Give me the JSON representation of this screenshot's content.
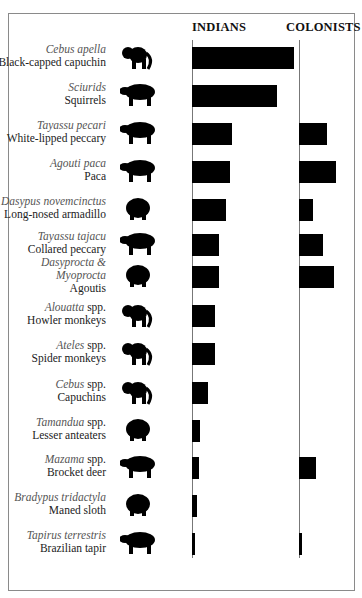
{
  "chart_data": {
    "type": "bar",
    "orientation": "horizontal",
    "title": "",
    "xlabel": "",
    "ylabel": "",
    "grid": false,
    "legend": null,
    "units": "relative bar length (no axis ticks shown; px from baseline at 1:1)",
    "categories": [
      "Black-capped capuchin",
      "Squirrels",
      "White-lipped peccary",
      "Paca",
      "Long-nosed armadillo",
      "Collared peccary",
      "Agoutis",
      "Howler monkeys",
      "Spider monkeys",
      "Capuchins",
      "Lesser anteaters",
      "Brocket deer",
      "Maned sloth",
      "Brazilian tapir"
    ],
    "series": [
      {
        "name": "INDIANS",
        "values": [
          102,
          85,
          40,
          38,
          34,
          27,
          27,
          23,
          23,
          16,
          8,
          7,
          5,
          3
        ]
      },
      {
        "name": "COLONISTS",
        "values": [
          0,
          0,
          28,
          37,
          14,
          24,
          35,
          0,
          0,
          0,
          0,
          17,
          0,
          3
        ]
      }
    ]
  },
  "headers": {
    "indians": "INDIANS",
    "colonists": "COLONISTS"
  },
  "rows": [
    {
      "sci": "Cebus apella",
      "sci_suffix": "",
      "common": "Black-capped capuchin",
      "icon": "capuchin-silhouette-icon"
    },
    {
      "sci": "Sciurids",
      "sci_suffix": "",
      "common": "Squirrels",
      "icon": "squirrel-silhouette-icon"
    },
    {
      "sci": "Tayassu pecari",
      "sci_suffix": "",
      "common": "White-lipped peccary",
      "icon": "peccary-silhouette-icon"
    },
    {
      "sci": "Agouti paca",
      "sci_suffix": "",
      "common": "Paca",
      "icon": "paca-silhouette-icon"
    },
    {
      "sci": "Dasypus novemcinctus",
      "sci_suffix": "",
      "common": "Long-nosed armadillo",
      "icon": "armadillo-silhouette-icon"
    },
    {
      "sci": "Tayassu tajacu",
      "sci_suffix": "",
      "common": "Collared peccary",
      "icon": "collared-peccary-silhouette-icon"
    },
    {
      "sci": "Dasyprocta &",
      "sci2": "Myoprocta",
      "sci_suffix": "",
      "common": "Agoutis",
      "icon": "agouti-silhouette-icon"
    },
    {
      "sci": "Alouatta",
      "sci_suffix": " spp.",
      "common": "Howler monkeys",
      "icon": "howler-monkey-silhouette-icon"
    },
    {
      "sci": "Ateles",
      "sci_suffix": " spp.",
      "common": "Spider monkeys",
      "icon": "spider-monkey-silhouette-icon"
    },
    {
      "sci": "Cebus",
      "sci_suffix": " spp.",
      "common": "Capuchins",
      "icon": "capuchin-monkey-silhouette-icon"
    },
    {
      "sci": "Tamandua",
      "sci_suffix": " spp.",
      "common": "Lesser anteaters",
      "icon": "anteater-silhouette-icon"
    },
    {
      "sci": "Mazama",
      "sci_suffix": " spp.",
      "common": "Brocket deer",
      "icon": "deer-silhouette-icon"
    },
    {
      "sci": "Bradypus tridactyla",
      "sci_suffix": "",
      "common": "Maned sloth",
      "icon": "sloth-silhouette-icon"
    },
    {
      "sci": "Tapirus terrestris",
      "sci_suffix": "",
      "common": "Brazilian tapir",
      "icon": "tapir-silhouette-icon"
    }
  ],
  "colors": {
    "bar": "#000000",
    "axis": "#777777",
    "frame": "#8a8a8a",
    "sci_text": "#555555",
    "common_text": "#222222"
  }
}
